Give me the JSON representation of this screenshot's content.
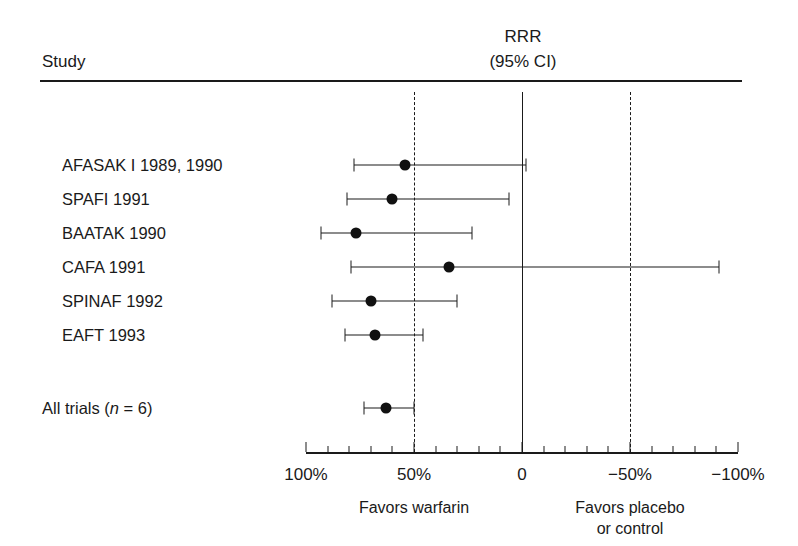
{
  "header": {
    "study_col": "Study",
    "rrr_title": "RRR",
    "rrr_subtitle": "(95% CI)"
  },
  "axis": {
    "ticks": [
      {
        "value": 100,
        "label": "100%"
      },
      {
        "value": 50,
        "label": "50%"
      },
      {
        "value": 0,
        "label": "0"
      },
      {
        "value": -50,
        "label": "−50%"
      },
      {
        "value": -100,
        "label": "−100%"
      }
    ],
    "minor_tick_step": 10,
    "range": [
      100,
      -100
    ],
    "reference_lines": [
      {
        "value": 50,
        "style": "dashed"
      },
      {
        "value": 0,
        "style": "solid"
      },
      {
        "value": -50,
        "style": "dashed"
      }
    ],
    "left_caption": "Favors warfarin",
    "right_caption": "Favors placebo\nor control"
  },
  "chart_data": {
    "type": "forest",
    "title": "RRR (95% CI)",
    "xlabel": "RRR",
    "ylabel": "Study",
    "xlim": [
      100,
      -100
    ],
    "x_inverted": true,
    "grid": false,
    "units": "percent",
    "studies": [
      {
        "label": "AFASAK I 1989, 1990",
        "estimate": 54,
        "ci_low": 78,
        "ci_high": -2,
        "summary": false
      },
      {
        "label": "SPAFI 1991",
        "estimate": 60,
        "ci_low": 81,
        "ci_high": 6,
        "summary": false
      },
      {
        "label": "BAATAK 1990",
        "estimate": 77,
        "ci_low": 93,
        "ci_high": 23,
        "summary": false
      },
      {
        "label": "CAFA 1991",
        "estimate": 34,
        "ci_low": 79,
        "ci_high": -91,
        "summary": false
      },
      {
        "label": "SPINAF 1992",
        "estimate": 70,
        "ci_low": 88,
        "ci_high": 30,
        "summary": false
      },
      {
        "label": "EAFT 1993",
        "estimate": 68,
        "ci_low": 82,
        "ci_high": 46,
        "summary": false
      },
      {
        "label": "All trials (n = 6)",
        "estimate": 63,
        "ci_low": 73,
        "ci_high": 50,
        "summary": true
      }
    ]
  },
  "summary_row": {
    "label_prefix": "All trials (",
    "label_italic": "n",
    "label_suffix": " = 6)"
  }
}
